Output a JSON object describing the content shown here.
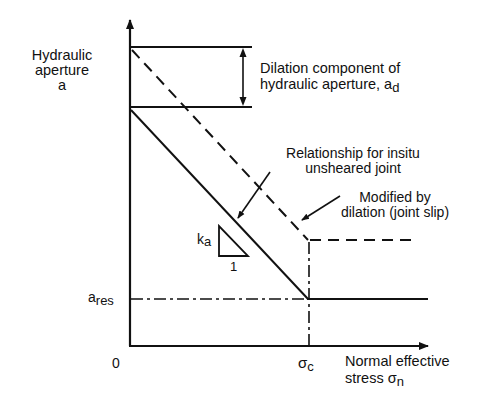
{
  "diagram": {
    "y_axis": {
      "line1": "Hydraulic",
      "line2": "aperture",
      "line3": "a"
    },
    "x_axis": {
      "line1": "Normal effective",
      "line2_prefix": "stress ",
      "symbol": "σ",
      "sub": "n"
    },
    "origin": "0",
    "a_res": {
      "base": "a",
      "sub": "res"
    },
    "sigma_c": {
      "base": "σ",
      "sub": "c"
    },
    "dilation_label": {
      "line1": "Dilation component of",
      "line2": "hydraulic aperture, a",
      "sub": "d"
    },
    "insitu_label": {
      "line1": "Relationship for insitu",
      "line2": "unsheared joint"
    },
    "modified_label": {
      "line1": "Modified by",
      "line2": "dilation (joint slip)"
    },
    "slope": {
      "k": "k",
      "sub": "a",
      "run": "1"
    }
  },
  "colors": {
    "ink": "#111111",
    "background": "#ffffff"
  }
}
